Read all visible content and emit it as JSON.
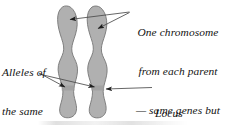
{
  "figure": {
    "background_color": "#ffffff",
    "width": 225,
    "height": 126
  },
  "colors": {
    "chromosome_fill": "#b0b0b0",
    "chromosome_stroke": "#6f6f6f",
    "leader_line": "#4a4a4a",
    "text": "#131313"
  },
  "labels": {
    "chromosome": {
      "name": "one-chromosome-from-each-parent",
      "lines": [
        "One chromosome",
        "from each parent",
        "— same genes but",
        "different alleles"
      ],
      "align": "center"
    },
    "alleles": {
      "name": "alleles-of-the-same-gene",
      "lines": [
        "Alleles of",
        "the same",
        "gene"
      ],
      "align": "left"
    },
    "locus": {
      "name": "locus",
      "lines": [
        "Locus"
      ],
      "align": "left"
    }
  },
  "chromosomes": [
    {
      "id": "left-chromosome",
      "label": "Maternal chromosome",
      "x_range": [
        55,
        79
      ],
      "y_range": [
        5,
        118
      ]
    },
    {
      "id": "right-chromosome",
      "label": "Paternal chromosome",
      "x_range": [
        84,
        108
      ],
      "y_range": [
        5,
        118
      ]
    }
  ],
  "locus_band": {
    "label": "Locus band",
    "y": 88,
    "description": "Dark horizontal band crossing both chromosomes at the same position"
  },
  "leaders": [
    {
      "name": "leader-chromosome-to-left",
      "from": "chromosome-label",
      "to": "left-chromosome-upper-arm"
    },
    {
      "name": "leader-chromosome-to-right",
      "from": "chromosome-label",
      "to": "right-chromosome-upper-arm"
    },
    {
      "name": "leader-alleles-to-left",
      "from": "alleles-label",
      "to": "left-chromosome-locus"
    },
    {
      "name": "leader-alleles-to-right",
      "from": "alleles-label",
      "to": "right-chromosome-locus"
    },
    {
      "name": "leader-locus-to-right",
      "from": "locus-label",
      "to": "right-chromosome-locus"
    }
  ]
}
